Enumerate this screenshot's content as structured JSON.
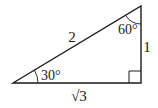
{
  "diagram": {
    "type": "right-triangle",
    "stroke_color": "#1a1a1a",
    "background": "#ffffff",
    "vertices": {
      "left": [
        13,
        83
      ],
      "top_right": [
        141,
        6
      ],
      "bottom_right": [
        141,
        83
      ]
    },
    "labels": {
      "hypotenuse": "2",
      "vertical_side": "1",
      "base": "√3",
      "angle_left": "30°",
      "angle_top": "60°"
    },
    "right_angle_marker": true
  }
}
